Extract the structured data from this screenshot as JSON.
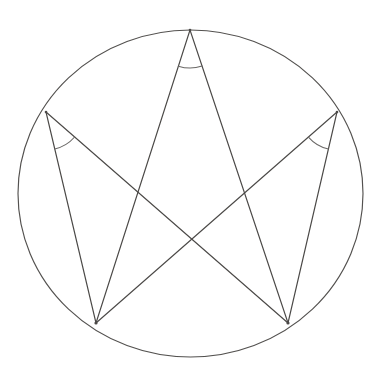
{
  "figure": {
    "background_color": "#ffffff",
    "stroke_color": "#4b4947",
    "circle_stroke_color": "#53514f",
    "arc_stroke_color": "#6a6866",
    "canvas": {
      "width": 383,
      "height": 389
    }
  },
  "circle": {
    "label": "circumscribed circle",
    "center_x": 190.5,
    "center_y": 193.5,
    "radius_x": 172.5,
    "radius_y": 163.5
  },
  "points": [
    {
      "id": "A",
      "name": "top-vertex",
      "x": 190,
      "y": 30
    },
    {
      "id": "B",
      "name": "upper-left-vertex",
      "x": 46,
      "y": 112
    },
    {
      "id": "C",
      "name": "upper-right-vertex",
      "x": 337,
      "y": 112
    },
    {
      "id": "D",
      "name": "lower-left-vertex",
      "x": 96,
      "y": 323
    },
    {
      "id": "E",
      "name": "lower-right-vertex",
      "x": 288,
      "y": 323
    }
  ],
  "segments": [
    {
      "id": "AD",
      "name": "chord-top-to-lower-left",
      "from": "A",
      "to": "D",
      "x1": 190,
      "y1": 30,
      "x2": 96,
      "y2": 323
    },
    {
      "id": "AE",
      "name": "chord-top-to-lower-right",
      "from": "A",
      "to": "E",
      "x1": 190,
      "y1": 30,
      "x2": 288,
      "y2": 323
    },
    {
      "id": "BD",
      "name": "chord-upper-left-to-lower-left",
      "from": "B",
      "to": "D",
      "x1": 46,
      "y1": 112,
      "x2": 96,
      "y2": 323
    },
    {
      "id": "BE",
      "name": "chord-upper-left-to-lower-right",
      "from": "B",
      "to": "E",
      "x1": 46,
      "y1": 112,
      "x2": 288,
      "y2": 323
    },
    {
      "id": "CE",
      "name": "chord-upper-right-to-lower-right",
      "from": "C",
      "to": "E",
      "x1": 337,
      "y1": 112,
      "x2": 288,
      "y2": 323
    },
    {
      "id": "CD",
      "name": "chord-upper-right-to-lower-left",
      "from": "C",
      "to": "D",
      "x1": 337,
      "y1": 112,
      "x2": 96,
      "y2": 323
    }
  ],
  "intersections": [
    {
      "id": "X1",
      "name": "center-crossing",
      "x": 192,
      "y": 240
    },
    {
      "id": "X2",
      "name": "upper-left-crossing",
      "x": 140,
      "y": 192
    },
    {
      "id": "X3",
      "name": "upper-right-crossing",
      "x": 243,
      "y": 192
    }
  ],
  "angle_marks": [
    {
      "id": "angle-A",
      "name": "angle-mark-top-vertex",
      "vertex": "A",
      "between": [
        "AD",
        "AE"
      ],
      "radius": 38,
      "path": "M 177.8 66.0 A 38 38 0 0 0 202.6 66.1"
    },
    {
      "id": "angle-B",
      "name": "angle-mark-upper-left-vertex",
      "vertex": "B",
      "between": [
        "BD",
        "BE"
      ],
      "radius": 38,
      "path": "M 54.6 149.1 A 38 38 0 0 0 82.1 138.7"
    },
    {
      "id": "angle-C",
      "name": "angle-mark-upper-right-vertex",
      "vertex": "C",
      "between": [
        "CE",
        "CD"
      ],
      "radius": 38,
      "path": "M 300.9 138.7 A 38 38 0 0 0 328.4 149.1"
    }
  ]
}
